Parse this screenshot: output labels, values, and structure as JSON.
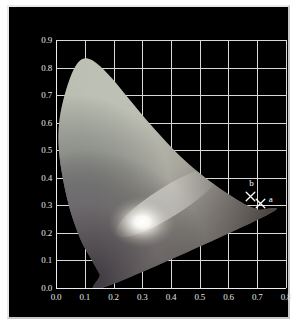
{
  "figure": {
    "background_color": "#ffffff",
    "panel_color": "#000000",
    "border_color": "#e9e9e9",
    "grid_color": "#d8d8d8",
    "tick_text_color": "#e4e4e4",
    "marker_color": "#ffffff"
  },
  "chart_data": {
    "type": "scatter",
    "title": "",
    "subtitle": "",
    "xlabel": "",
    "ylabel": "",
    "xlim": [
      0.0,
      0.8
    ],
    "ylim": [
      0.0,
      0.9
    ],
    "grid": true,
    "legend": "none",
    "background": "black",
    "plot_kind": "CIE 1931 xy chromaticity diagram",
    "xticks": [
      "0.0",
      "0.1",
      "0.2",
      "0.3",
      "0.4",
      "0.5",
      "0.6",
      "0.7",
      "0.8"
    ],
    "xtick_values": [
      0.0,
      0.1,
      0.2,
      0.3,
      0.4,
      0.5,
      0.6,
      0.7,
      0.8
    ],
    "yticks": [
      "0.0",
      "0.1",
      "0.2",
      "0.3",
      "0.4",
      "0.5",
      "0.6",
      "0.7",
      "0.8",
      "0.9"
    ],
    "ytick_values": [
      0.0,
      0.1,
      0.2,
      0.3,
      0.4,
      0.5,
      0.6,
      0.7,
      0.8,
      0.9
    ],
    "annotations": [
      {
        "label": "b",
        "x": 0.676,
        "y": 0.333,
        "marker": "x",
        "label_dx": -0.004,
        "label_dy": 0.045
      },
      {
        "label": "a",
        "x": 0.712,
        "y": 0.305,
        "marker": "x",
        "label_dx": 0.028,
        "label_dy": 0.016
      }
    ],
    "series": [
      {
        "name": "gamut-markers",
        "marker": "x",
        "color": "#ffffff",
        "points": [
          {
            "label": "b",
            "x": 0.676,
            "y": 0.333
          },
          {
            "label": "a",
            "x": 0.712,
            "y": 0.305
          }
        ]
      }
    ],
    "spectral_locus": {
      "description": "CIE 1931 horseshoe outline, rendered desaturated/washed-out",
      "peak": {
        "x": 0.1,
        "y": 0.83
      },
      "red_tip": {
        "x": 0.735,
        "y": 0.265
      },
      "purple_line_base": {
        "x": 0.175,
        "y": 0.005
      },
      "bright_point": {
        "x": 0.3,
        "y": 0.24
      },
      "boundary_xy": [
        [
          0.175,
          0.005
        ],
        [
          0.152,
          0.05
        ],
        [
          0.12,
          0.11
        ],
        [
          0.084,
          0.18
        ],
        [
          0.046,
          0.295
        ],
        [
          0.02,
          0.42
        ],
        [
          0.009,
          0.52
        ],
        [
          0.012,
          0.61
        ],
        [
          0.03,
          0.7
        ],
        [
          0.055,
          0.778
        ],
        [
          0.08,
          0.822
        ],
        [
          0.11,
          0.833
        ],
        [
          0.145,
          0.812
        ],
        [
          0.195,
          0.76
        ],
        [
          0.25,
          0.69
        ],
        [
          0.31,
          0.615
        ],
        [
          0.37,
          0.545
        ],
        [
          0.43,
          0.48
        ],
        [
          0.49,
          0.425
        ],
        [
          0.545,
          0.38
        ],
        [
          0.6,
          0.34
        ],
        [
          0.655,
          0.305
        ],
        [
          0.7,
          0.285
        ],
        [
          0.735,
          0.265
        ],
        [
          0.175,
          0.005
        ]
      ]
    }
  }
}
